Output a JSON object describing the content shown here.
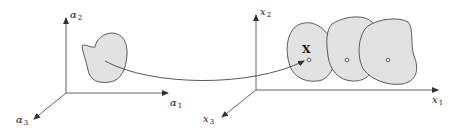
{
  "diagram": {
    "type": "mapping-between-spaces",
    "colors": {
      "fill": "#e2e2e2",
      "stroke": "#4a4a4a",
      "axis": "#555555",
      "text": "#222222"
    },
    "left_space": {
      "axes": [
        {
          "name": "alpha1",
          "symbol": "α",
          "index": "1",
          "direction": "right"
        },
        {
          "name": "alpha2",
          "symbol": "α",
          "index": "2",
          "direction": "up"
        },
        {
          "name": "alpha3",
          "symbol": "α",
          "index": "3",
          "direction": "down-left"
        }
      ],
      "regions": 1
    },
    "right_space": {
      "axes": [
        {
          "name": "x1",
          "symbol": "x",
          "index": "1",
          "direction": "right"
        },
        {
          "name": "x2",
          "symbol": "x",
          "index": "2",
          "direction": "up"
        },
        {
          "name": "x3",
          "symbol": "x",
          "index": "3",
          "direction": "down-left"
        }
      ],
      "regions": 3,
      "point_label": "X"
    },
    "mapping_arrow": {
      "from": "left-region",
      "to": "point-X"
    }
  }
}
